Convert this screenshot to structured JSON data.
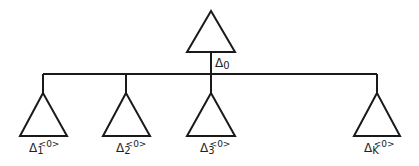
{
  "diagram": {
    "type": "tree",
    "line_color": "#1a1a1a",
    "root": {
      "symbol": "Δ",
      "subscript": "0",
      "superscript": ""
    },
    "children": [
      {
        "symbol": "Δ",
        "subscript": "1",
        "superscript": "<0>"
      },
      {
        "symbol": "Δ",
        "subscript": "2",
        "superscript": "<0>"
      },
      {
        "symbol": "Δ",
        "subscript": "3",
        "superscript": "<0>"
      },
      {
        "symbol": "Δ",
        "subscript": "K",
        "superscript": "<0>"
      }
    ]
  }
}
